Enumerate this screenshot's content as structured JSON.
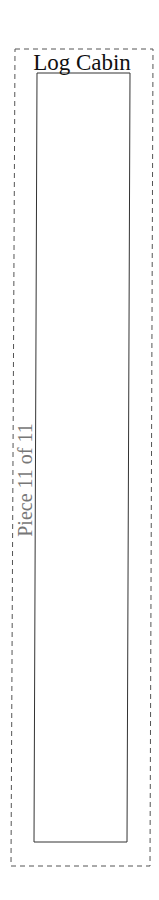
{
  "pattern": {
    "title": "Log Cabin",
    "piece_label": "Piece 11 of 11",
    "piece_number": 11,
    "piece_total": 11
  },
  "colors": {
    "cut_line": "#555555",
    "seam_line": "#333333",
    "title_text": "#111111",
    "piece_text": "#777777",
    "background": "#ffffff"
  }
}
